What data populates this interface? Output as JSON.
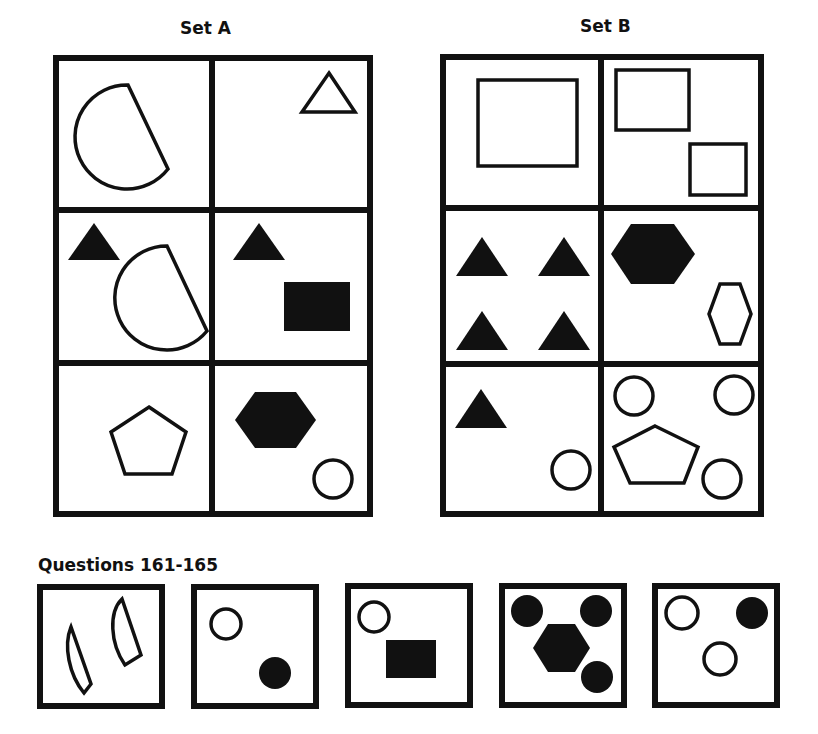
{
  "set_a": {
    "title": "Set A",
    "cells": [
      {
        "row": 1,
        "col": 1,
        "shapes": [
          "outline semicircle (D-shape)"
        ]
      },
      {
        "row": 1,
        "col": 2,
        "shapes": [
          "outline triangle"
        ]
      },
      {
        "row": 2,
        "col": 1,
        "shapes": [
          "filled triangle",
          "outline semicircle (D-shape)"
        ]
      },
      {
        "row": 2,
        "col": 2,
        "shapes": [
          "filled triangle",
          "filled rectangle"
        ]
      },
      {
        "row": 3,
        "col": 1,
        "shapes": [
          "outline pentagon"
        ]
      },
      {
        "row": 3,
        "col": 2,
        "shapes": [
          "filled hexagon",
          "outline circle"
        ]
      }
    ]
  },
  "set_b": {
    "title": "Set B",
    "cells": [
      {
        "row": 1,
        "col": 1,
        "shapes": [
          "outline rectangle"
        ]
      },
      {
        "row": 1,
        "col": 2,
        "shapes": [
          "outline rectangle",
          "outline rectangle"
        ]
      },
      {
        "row": 2,
        "col": 1,
        "shapes": [
          "filled triangle",
          "filled triangle",
          "filled triangle",
          "filled triangle"
        ]
      },
      {
        "row": 2,
        "col": 2,
        "shapes": [
          "filled hexagon",
          "outline hexagon"
        ]
      },
      {
        "row": 3,
        "col": 1,
        "shapes": [
          "filled triangle",
          "outline circle"
        ]
      },
      {
        "row": 3,
        "col": 2,
        "shapes": [
          "outline circle",
          "outline circle",
          "outline pentagon",
          "outline circle"
        ]
      }
    ]
  },
  "questions": {
    "title": "Questions 161-165",
    "items": [
      {
        "number": 161,
        "shapes": [
          "outline semicircle",
          "outline semicircle"
        ]
      },
      {
        "number": 162,
        "shapes": [
          "outline circle",
          "filled circle"
        ]
      },
      {
        "number": 163,
        "shapes": [
          "outline circle",
          "filled rectangle"
        ]
      },
      {
        "number": 164,
        "shapes": [
          "filled circle",
          "filled circle",
          "filled hexagon",
          "filled circle"
        ]
      },
      {
        "number": 165,
        "shapes": [
          "outline circle",
          "filled circle",
          "outline circle"
        ]
      }
    ]
  }
}
